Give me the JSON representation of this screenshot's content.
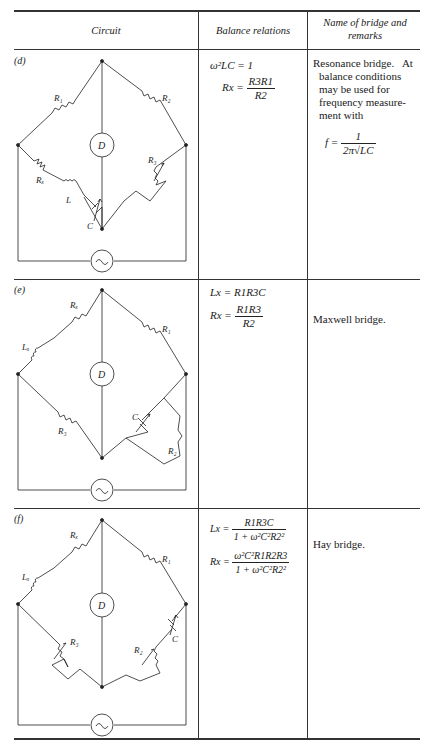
{
  "header": {
    "col1": "Circuit",
    "col2": "Balance relations",
    "col3": "Name of bridge and remarks"
  },
  "rows": [
    {
      "label": "(d)",
      "components": [
        "R1",
        "R2",
        "Rx",
        "L",
        "C",
        "R3",
        "D",
        "~"
      ],
      "relations": {
        "eq1": "ω²LC = 1",
        "eq2_lhs": "Rx =",
        "eq2_num": "R3R1",
        "eq2_den": "R2"
      },
      "remarks": {
        "line1": "Resonance bridge.   At",
        "rest": [
          "balance conditions",
          "may be used for",
          "frequency measure-",
          "ment with"
        ],
        "formula_lhs": "f =",
        "formula_num": "1",
        "formula_den": "2π√LC"
      }
    },
    {
      "label": "(e)",
      "components": [
        "Rx",
        "Lx",
        "R1",
        "R3",
        "C",
        "R2",
        "D",
        "~"
      ],
      "relations": {
        "eq1": "Lx = R1R3C",
        "eq2_lhs": "Rx =",
        "eq2_num": "R1R3",
        "eq2_den": "R2"
      },
      "remarks": {
        "line1": "Maxwell bridge."
      }
    },
    {
      "label": "(f)",
      "components": [
        "Rx",
        "Lx",
        "R1",
        "R3",
        "R2",
        "C",
        "D",
        "~"
      ],
      "relations": {
        "eq1_lhs": "Lx =",
        "eq1_num": "R1R3C",
        "eq1_den": "1 + ω²C²R2²",
        "eq2_lhs": "Rx =",
        "eq2_num": "ω²C²R1R2R3",
        "eq2_den": "1 + ω²C²R2²"
      },
      "remarks": {
        "line1": "Hay bridge."
      }
    }
  ]
}
